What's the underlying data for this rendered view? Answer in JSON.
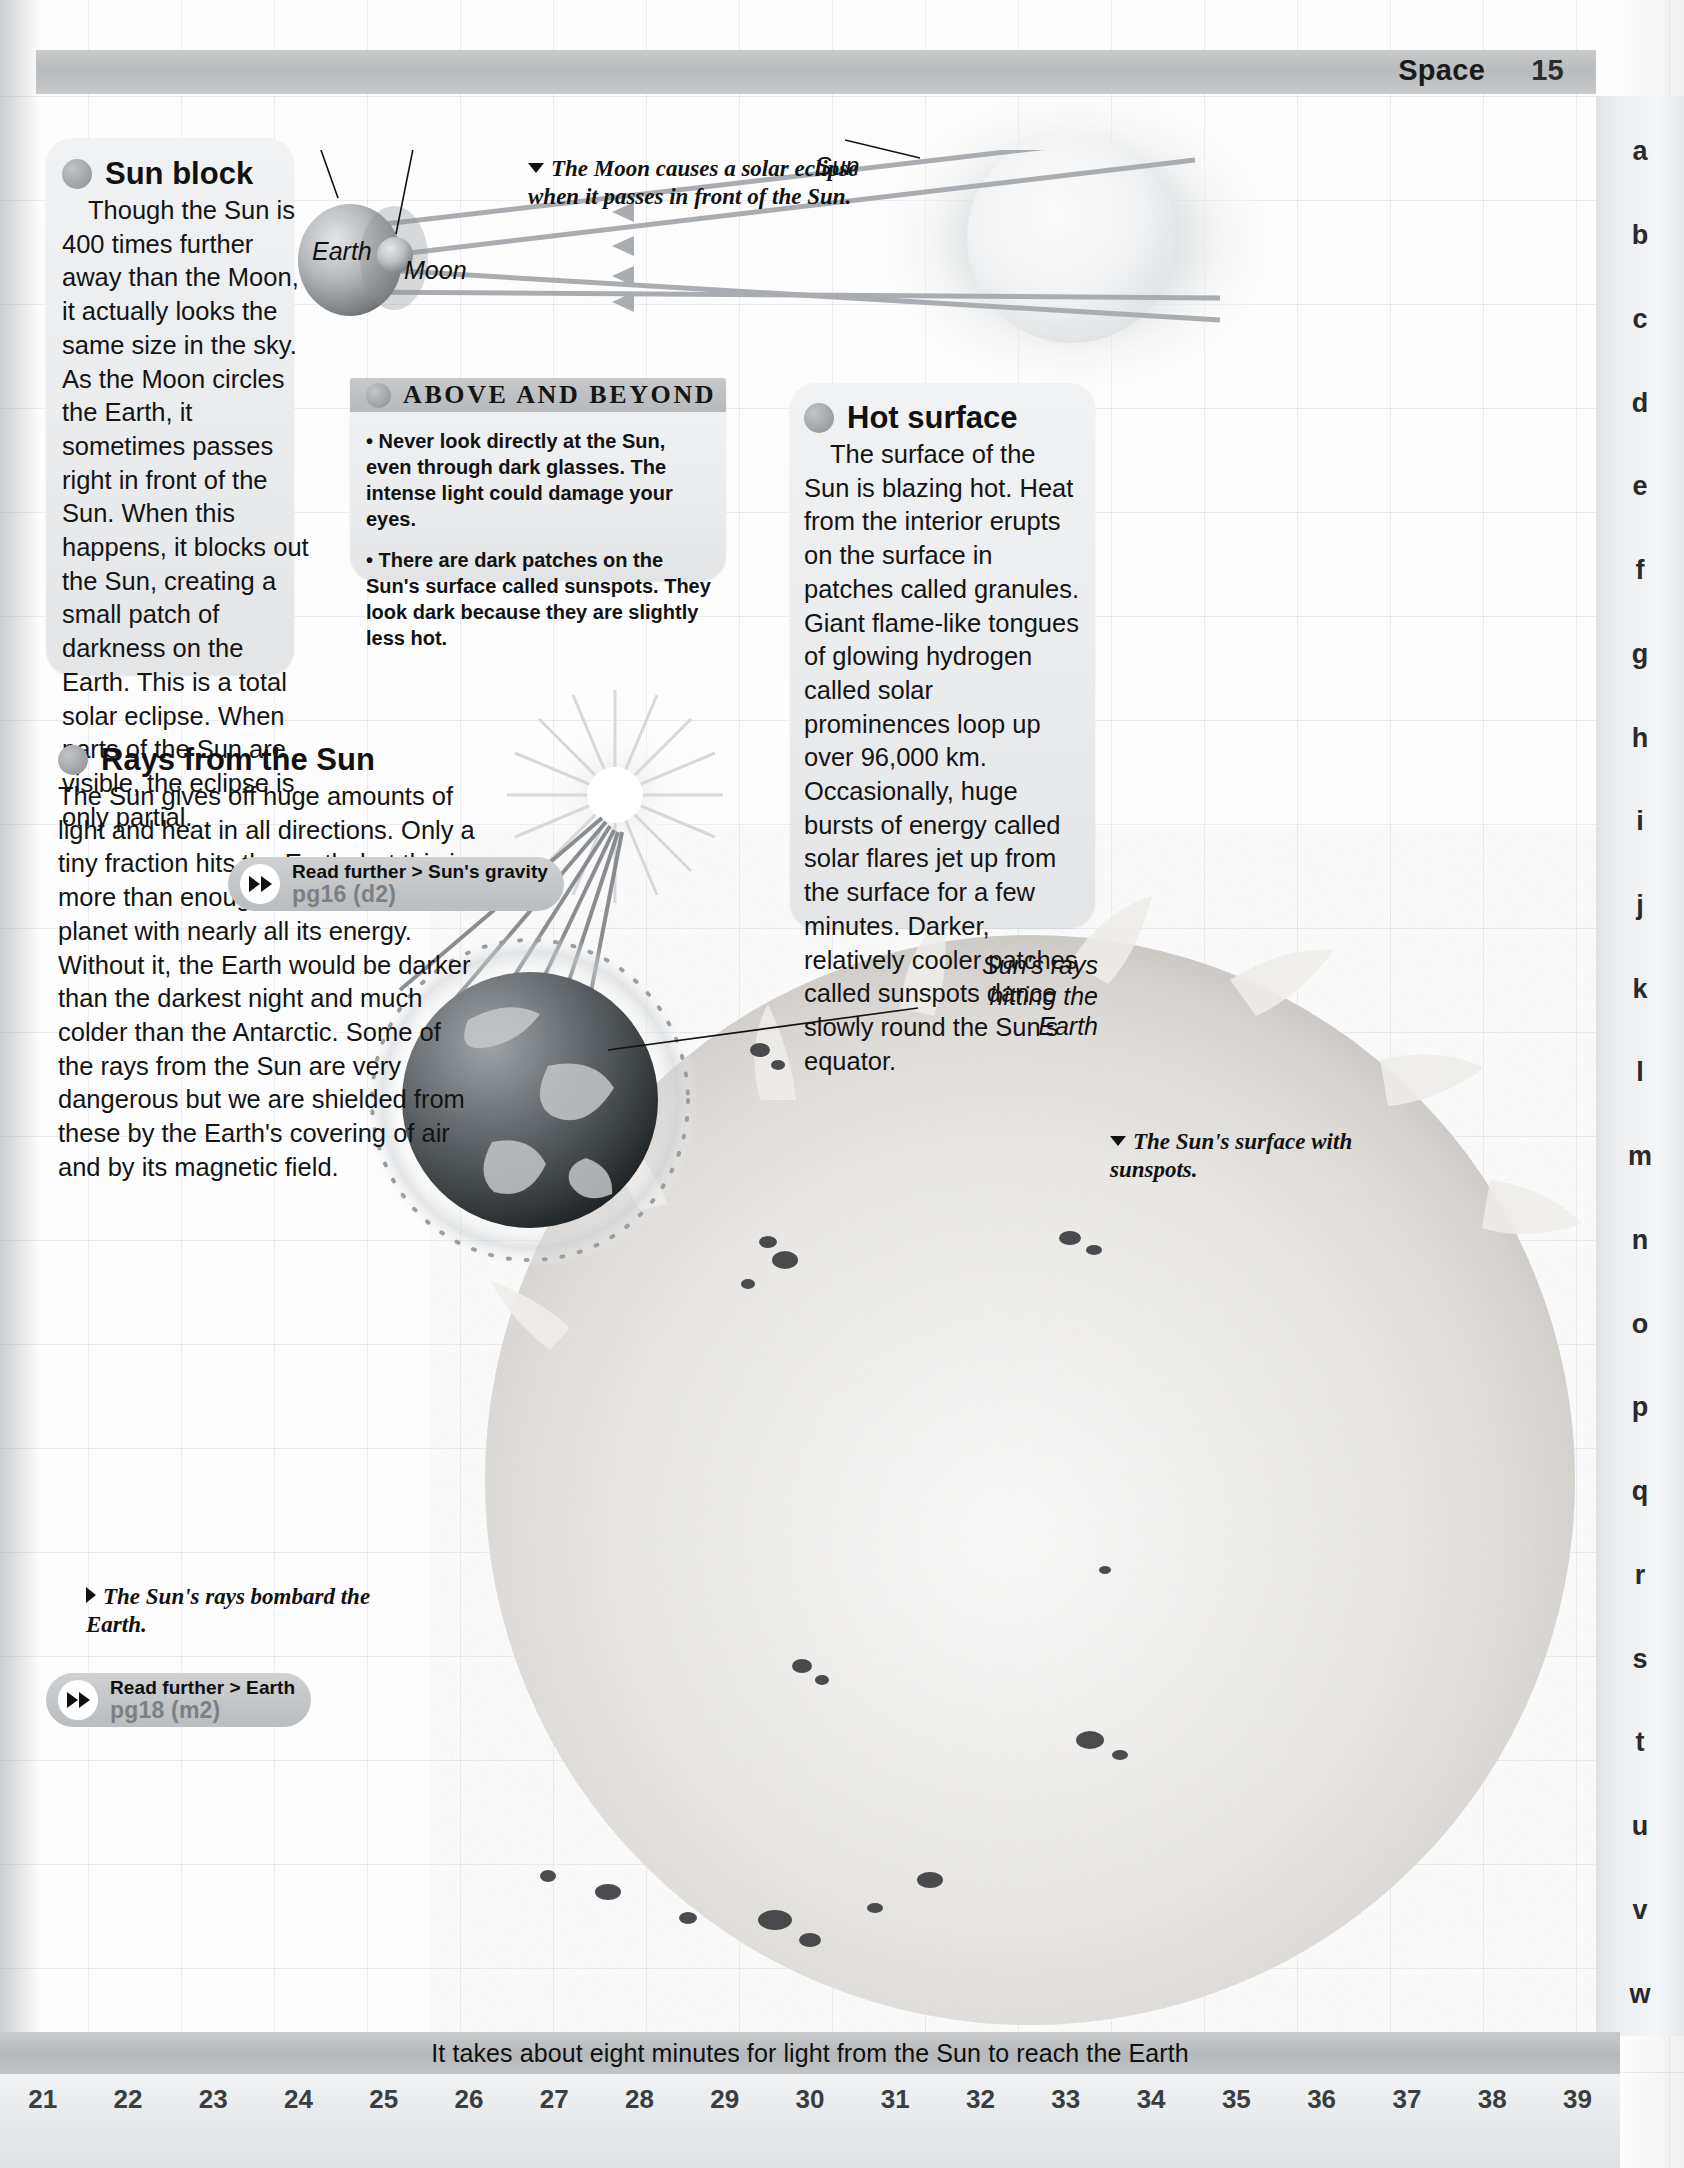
{
  "header": {
    "title": "Space",
    "page_no": "15"
  },
  "alphabet_tabs": [
    "a",
    "b",
    "c",
    "d",
    "e",
    "f",
    "g",
    "h",
    "i",
    "j",
    "k",
    "l",
    "m",
    "n",
    "o",
    "p",
    "q",
    "r",
    "s",
    "t",
    "u",
    "v",
    "w"
  ],
  "sun_block": {
    "heading": "Sun block",
    "body": "Though the Sun is 400 times further away than the Moon, it actually looks the same size in the sky. As the Moon circles the Earth, it sometimes passes right in front of the Sun. When this happens, it blocks out the Sun, creating a small patch of darkness on the Earth. This is a total solar eclipse. When parts of the Sun are visible, the eclipse is only partial."
  },
  "above_and_beyond": {
    "title": "ABOVE AND BEYOND",
    "bullets": [
      "• Never look directly at the Sun, even through dark glasses. The intense light could damage your eyes.",
      "• There are dark patches on the Sun's surface called sunspots. They look dark because they are slightly less hot."
    ]
  },
  "hot_surface": {
    "heading": "Hot surface",
    "body": "The surface of the Sun is blazing hot. Heat from the interior erupts on the surface in patches called granules. Giant flame-like tongues of glowing hydrogen called solar prominences loop up over 96,000 km. Occasionally, huge bursts of energy called solar flares jet up from the surface for a few minutes. Darker, relatively cooler patches called sunspots dance slowly round the Sun's equator."
  },
  "rays_from_sun": {
    "heading": "Rays from the Sun",
    "body": "The Sun gives off huge amounts of light and heat in all directions. Only a tiny fraction hits the Earth, but this is more than enough to provide the planet with nearly all its energy. Without it, the Earth would be darker than the darkest night and much colder than the Antarctic. Some of the rays from the Sun are very dangerous but we are shielded from these by the Earth's covering of air and by its magnetic field."
  },
  "read_further": [
    {
      "label": "Read further > Sun's gravity",
      "page_ref": "pg16 (d2)"
    },
    {
      "label": "Read further > Earth",
      "page_ref": "pg18 (m2)"
    }
  ],
  "check_it_out": {
    "title": "Check it out!",
    "links": [
      "http://kids.msfc.nasa.gov/SolarSystem/Sun/",
      "http://www.michielb.nl/sun/kaft.htm"
    ]
  },
  "captions": {
    "eclipse": "The Moon causes a solar eclipse when it passes in front of the Sun.",
    "sunspots": "The Sun's surface with sunspots.",
    "bombard": "The Sun's rays bombard the Earth."
  },
  "diagram_labels": {
    "earth": "Earth",
    "moon": "Moon",
    "sun": "Sun",
    "rays_hitting": "Sun's rays hitting the Earth"
  },
  "footer": {
    "fact": "It takes about eight minutes for light from the Sun to reach the Earth",
    "ruler_numbers": [
      "21",
      "22",
      "23",
      "24",
      "25",
      "26",
      "27",
      "28",
      "29",
      "30",
      "31",
      "32",
      "33",
      "34",
      "35",
      "36",
      "37",
      "38",
      "39"
    ]
  },
  "colors": {
    "band_gray": "#bdc0c2",
    "box_gray": "#eaebec",
    "pill_gray": "#c2c5c7",
    "text_dark": "#141414"
  }
}
